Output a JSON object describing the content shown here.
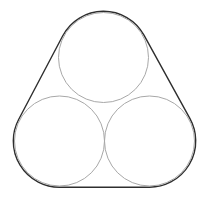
{
  "diagram": {
    "canvas": {
      "width": 209,
      "height": 202,
      "background": "#ffffff"
    },
    "circles": [
      {
        "id": "top",
        "cx": 103.5,
        "cy": 57.5,
        "r": 45
      },
      {
        "id": "bottom-left",
        "cx": 59.5,
        "cy": 141,
        "r": 45
      },
      {
        "id": "bottom-right",
        "cx": 149.5,
        "cy": 141,
        "r": 45
      }
    ],
    "circle_stroke": "#a8a8a8",
    "circle_stroke_width": 1,
    "band_offset": 1.2,
    "band_stroke": "#2e2e2e",
    "band_stroke_width": 1.4
  }
}
